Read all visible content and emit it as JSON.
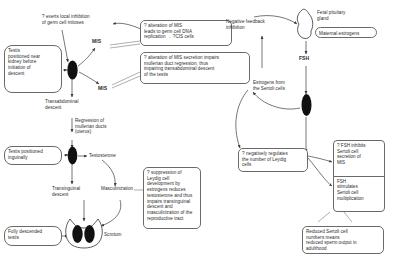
{
  "diagram": {
    "nodes": {
      "testis_kidney": "Testis\npositioned near\nkidney before\ninitiation of\ndescent",
      "testis_inguinal": "Testis positioned\ninguinally",
      "fully_descended": "Fully descended\ntestis",
      "maternal_estrogens": "Maternal estrogens"
    },
    "labels": {
      "germ_cell_inhibition": "? exerts local inhibition\nof germ cell mitoses",
      "mis_upper": "MIS",
      "mis_lower": "MIS",
      "transabdominal_descent": "Transabdominal\ndescent",
      "regression_mullerian": "Regression of\nmullerian ducts\n(uterus)",
      "testosterone": "Testosterone",
      "transinguinal_descent": "Transinguinal\ndescent",
      "masculinization": "Masculinization",
      "scrotum": "Scrotum",
      "negative_feedback": "Negative feedback\ninhibition",
      "fetal_pituitary": "Fetal pituitary\ngland",
      "fsh": "FSH",
      "estrogens_sertoli": "Estrogens from\nthe Sertoli cells"
    },
    "annotations": {
      "mis_dna_replication": "? alteration of MIS\nleads to germ cell DNA\nreplication → ?CIS cells",
      "mis_secretion": "? alteration of MIS secretion impairs\nmullerian duct regression, thus\nimpairing transabdominal descent\nof the testis",
      "leydig_suppression": "? suppression of\nLeydig cell\ndevelopment by\nestrogens reduces\ntestosterone and thus\nimpairs transinguinal\ndescent and\nmasculinization of the\nreproductive tract",
      "negatively_regulates": "? negatively regulates\nthe number of Leydig\ncells",
      "fsh_inhibits": "? FSH inhibits\nSertoli cell\nsecretion of\nMIS",
      "fsh_stimulates": "FSH\nstimulates\nSertoli cell\nmultiplication",
      "reduced_sertoli": "Reduced Sertoli cell\nnumbers means\nreduced sperm output in\nadulthood"
    },
    "colors": {
      "line": "#4a4a4a",
      "box_border": "#6a6a6a",
      "organ_fill": "#111111",
      "text": "#2b2b2b",
      "background": "#ffffff"
    }
  }
}
